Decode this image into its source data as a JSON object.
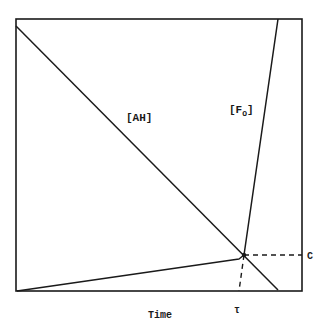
{
  "diagram": {
    "curves": [
      {
        "name": "AH",
        "label": "[AH]",
        "description": "linear decrease over time"
      },
      {
        "name": "F0",
        "label_main": "[F",
        "label_sub": "O",
        "label_close": "]",
        "description": "slow rise then sharp rise after T"
      }
    ],
    "x_axis_label": "Time",
    "marker_x_label": "τ",
    "marker_y_label": "C",
    "colors": {
      "line": "#1a1a1a",
      "background": "#ffffff"
    }
  }
}
